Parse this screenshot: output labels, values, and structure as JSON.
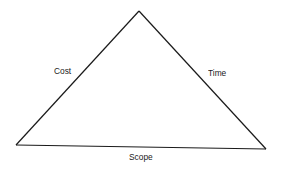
{
  "diagram": {
    "type": "triangle",
    "title": "",
    "line_color": "#1a1a1a",
    "vertices": {
      "apex": [
        139,
        11
      ],
      "bottom_left": [
        16,
        145
      ],
      "bottom_right": [
        266,
        149
      ]
    },
    "edges": [
      {
        "side": "left",
        "label": "Cost"
      },
      {
        "side": "right",
        "label": "Time"
      },
      {
        "side": "bottom",
        "label": "Scope"
      }
    ]
  }
}
